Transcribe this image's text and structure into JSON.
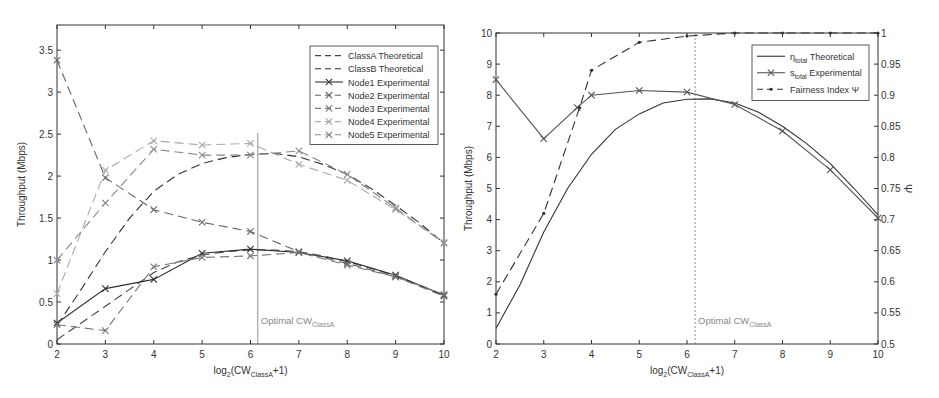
{
  "chart_data": [
    {
      "type": "line",
      "title": "",
      "xlabel": "log2(CW_ClassA+1)",
      "xlabel_parts": {
        "pre": "log",
        "sub1": "2",
        "mid": "(CW",
        "sub2": "ClassA",
        "post": "+1)"
      },
      "ylabel": "Throughput (Mbps)",
      "xlim": [
        2,
        10
      ],
      "ylim": [
        0,
        3.8
      ],
      "xticks": [
        2,
        3,
        4,
        5,
        6,
        7,
        8,
        9,
        10
      ],
      "yticks": [
        0,
        0.5,
        1,
        1.5,
        2,
        2.5,
        3,
        3.5
      ],
      "ytick_labels": [
        "0",
        "0.5",
        "1",
        "1.5",
        "2",
        "2.5",
        "3",
        "3.5"
      ],
      "grid": false,
      "legend_position": "upper right",
      "annotation": {
        "text": "Optimal CW",
        "sub": "ClassA",
        "x": 6.15
      },
      "x": [
        2,
        3,
        4,
        5,
        6,
        7,
        8,
        9,
        10
      ],
      "series": [
        {
          "name": "ClassA Theoretical",
          "style": "dash",
          "color": "#444444",
          "marker": "none",
          "x": [
            2,
            2.5,
            3,
            3.5,
            4,
            4.5,
            5,
            5.5,
            6,
            6.5,
            7,
            7.5,
            8,
            8.5,
            9,
            9.5,
            10
          ],
          "values": [
            0.05,
            0.25,
            0.45,
            0.65,
            0.85,
            0.98,
            1.06,
            1.1,
            1.12,
            1.12,
            1.1,
            1.05,
            0.98,
            0.9,
            0.81,
            0.7,
            0.58
          ]
        },
        {
          "name": "ClassB Theoretical",
          "style": "dash",
          "color": "#333333",
          "marker": "none",
          "x": [
            2,
            2.5,
            3,
            3.5,
            4,
            4.5,
            5,
            5.5,
            6,
            6.5,
            7,
            7.5,
            8,
            8.5,
            9,
            9.5,
            10
          ],
          "values": [
            0.22,
            0.65,
            1.1,
            1.5,
            1.82,
            2.02,
            2.15,
            2.22,
            2.26,
            2.27,
            2.23,
            2.14,
            2.02,
            1.85,
            1.65,
            1.44,
            1.2
          ]
        },
        {
          "name": "Node1 Experimental",
          "style": "solid",
          "color": "#333333",
          "marker": "x",
          "values": [
            0.25,
            0.66,
            0.77,
            1.08,
            1.13,
            1.09,
            0.99,
            0.82,
            0.58
          ]
        },
        {
          "name": "Node2 Experimental",
          "style": "dash",
          "color": "#666666",
          "marker": "x",
          "values": [
            3.38,
            1.98,
            1.6,
            1.45,
            1.34,
            1.1,
            0.96,
            0.8,
            0.57
          ]
        },
        {
          "name": "Node3 Experimental",
          "style": "dash",
          "color": "#777777",
          "marker": "x",
          "values": [
            0.23,
            0.16,
            0.92,
            1.03,
            1.05,
            1.09,
            0.94,
            0.8,
            0.59
          ]
        },
        {
          "name": "Node4 Experimental",
          "style": "dash",
          "color": "#aaaaaa",
          "marker": "x",
          "values": [
            0.6,
            2.07,
            2.42,
            2.37,
            2.39,
            2.14,
            1.95,
            1.6,
            1.21
          ]
        },
        {
          "name": "Node5 Experimental",
          "style": "dash",
          "color": "#888888",
          "marker": "x",
          "values": [
            1.0,
            1.68,
            2.32,
            2.25,
            2.25,
            2.3,
            2.02,
            1.62,
            1.2
          ]
        }
      ],
      "extra_point_note": "Node series also touch ~3.25 at x=2 (overlapping traces)"
    },
    {
      "type": "line",
      "title": "",
      "xlabel": "log2(CW_ClassA+1)",
      "xlabel_parts": {
        "pre": "log",
        "sub1": "2",
        "mid": "(CW",
        "sub2": "ClassA",
        "post": "+1)"
      },
      "ylabel": "Throughput (Mbps)",
      "ylabel_right": "Ψ",
      "xlim": [
        2,
        10
      ],
      "ylim": [
        0,
        10
      ],
      "ylim_right": [
        0.5,
        1.0
      ],
      "xticks": [
        2,
        3,
        4,
        5,
        6,
        7,
        8,
        9,
        10
      ],
      "yticks": [
        0,
        1,
        2,
        3,
        4,
        5,
        6,
        7,
        8,
        9,
        10
      ],
      "yticks_right": [
        0.5,
        0.55,
        0.6,
        0.65,
        0.7,
        0.75,
        0.8,
        0.85,
        0.9,
        0.95,
        1
      ],
      "ytick_right_labels": [
        "0.5",
        "0.55",
        "0.6",
        "0.65",
        "0.7",
        "0.75",
        "0.8",
        "0.85",
        "0.9",
        "0.95",
        "1"
      ],
      "grid": false,
      "legend_position": "upper right",
      "annotation": {
        "text": "Optimal CW",
        "sub": "ClassA",
        "x": 6.17
      },
      "series": [
        {
          "name": "η_total Theoretical",
          "legend": {
            "sym": "η",
            "sub": "total",
            "rest": " Theoretical"
          },
          "style": "solid",
          "color": "#333333",
          "marker": "none",
          "axis": "left",
          "x": [
            2,
            2.5,
            3,
            3.5,
            4,
            4.5,
            5,
            5.5,
            6,
            6.5,
            7,
            7.5,
            8,
            8.5,
            9,
            9.5,
            10
          ],
          "values": [
            0.5,
            1.9,
            3.6,
            5.0,
            6.1,
            6.9,
            7.4,
            7.75,
            7.87,
            7.88,
            7.75,
            7.45,
            7.0,
            6.45,
            5.8,
            5.0,
            4.15
          ]
        },
        {
          "name": "s_total Experimental",
          "legend": {
            "sym": "s",
            "sub": "total",
            "rest": " Experimental"
          },
          "style": "solid",
          "color": "#555555",
          "marker": "x",
          "axis": "left",
          "x": [
            2,
            3,
            3.7,
            4,
            5,
            6,
            7,
            8,
            9,
            10
          ],
          "values": [
            8.5,
            6.6,
            7.6,
            8.0,
            8.15,
            8.1,
            7.7,
            6.85,
            5.6,
            4.05
          ]
        },
        {
          "name": "Fairness Index Ψ",
          "legend": {
            "sym": "Fairness Index Ψ",
            "sub": "",
            "rest": ""
          },
          "style": "dash",
          "color": "#333333",
          "marker": "dot",
          "axis": "right",
          "x": [
            2,
            3,
            3.75,
            4,
            5,
            6,
            7,
            8,
            9,
            10
          ],
          "values": [
            0.58,
            0.71,
            0.88,
            0.94,
            0.985,
            0.995,
            1.0,
            1.0,
            1.0,
            1.0
          ]
        }
      ]
    }
  ]
}
